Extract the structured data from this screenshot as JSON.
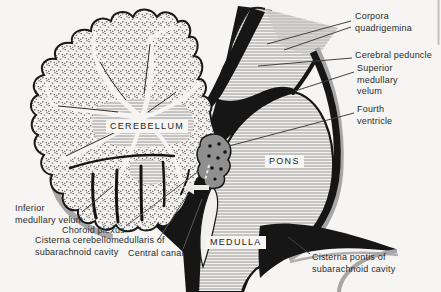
{
  "structures": {
    "cerebellum": "CEREBELLUM",
    "pons": "PONS",
    "medulla": "MEDULLA"
  },
  "annotations": {
    "corpora_quadrigemina": {
      "lines": [
        "Corpora",
        "quadrigemina"
      ]
    },
    "cerebral_peduncle": {
      "lines": [
        "Cerebral peduncle"
      ]
    },
    "superior_medullary_velum": {
      "lines": [
        "Superior",
        "medullary",
        "velum"
      ]
    },
    "fourth_ventricle": {
      "lines": [
        "Fourth",
        "ventricle"
      ]
    },
    "cisterna_pontis": {
      "lines": [
        "Cisterna pontis of",
        "subarachnoid cavity"
      ]
    },
    "inferior_medullary_velum": {
      "lines": [
        "Inferior",
        "medullary velum"
      ]
    },
    "choroid_plexus": {
      "lines": [
        "Choroid plexus"
      ]
    },
    "cisterna_cerebellomedullaris": {
      "lines": [
        "Cisterna cerebellomedullaris of",
        "subarachnoid cavity"
      ]
    },
    "central_canal": {
      "lines": [
        "Central canal"
      ]
    }
  },
  "icons": {
    "csf_flow_arrow": "left-arrow",
    "csf_flow_dashes": "dashed-flow"
  },
  "colors": {
    "background": "#f6f5f3",
    "ink": "#161616",
    "hatch_line": "#8f8f8f",
    "stipple_dot": "#707070",
    "gray_band": "#a6a6a6",
    "choroid_gray": "#8f8f8f",
    "label_text": "#2b2b2b"
  }
}
